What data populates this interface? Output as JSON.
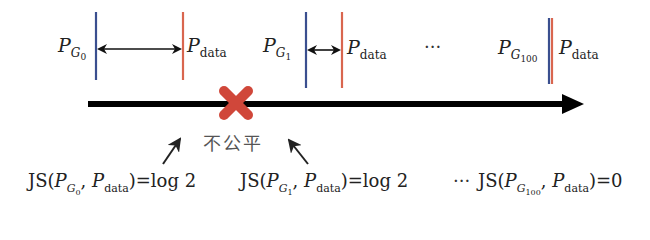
{
  "diagram": {
    "colors": {
      "generator_line": "#3a4f8f",
      "data_line": "#d9664f",
      "axis": "#000000",
      "cross": "#d0473a",
      "text": "#222222"
    },
    "groups": [
      {
        "generator_label": "P",
        "generator_sub": "G",
        "generator_subsub": "0",
        "data_label": "P",
        "data_sub": "data",
        "distance": "far"
      },
      {
        "generator_label": "P",
        "generator_sub": "G",
        "generator_subsub": "1",
        "data_label": "P",
        "data_sub": "data",
        "distance": "near"
      },
      {
        "generator_label": "P",
        "generator_sub": "G",
        "generator_subsub": "100",
        "data_label": "P",
        "data_sub": "data",
        "distance": "overlap"
      }
    ],
    "ellipsis": "···",
    "unfair_label": "不公平",
    "formulas": [
      {
        "prefix": "JS(",
        "g_label": "P",
        "g_sub": "G",
        "g_subsub": "0",
        "sep": ", ",
        "d_label": "P",
        "d_sub": "data",
        "suffix": ")=log 2"
      },
      {
        "prefix": "JS(",
        "g_label": "P",
        "g_sub": "G",
        "g_subsub": "1",
        "sep": ", ",
        "d_label": "P",
        "d_sub": "data",
        "suffix": ")=log 2"
      },
      {
        "prefix": "JS(",
        "g_label": "P",
        "g_sub": "G",
        "g_subsub": "100",
        "sep": ", ",
        "d_label": "P",
        "d_sub": "data",
        "suffix": ")=0"
      }
    ],
    "formula_ellipsis": "···"
  }
}
